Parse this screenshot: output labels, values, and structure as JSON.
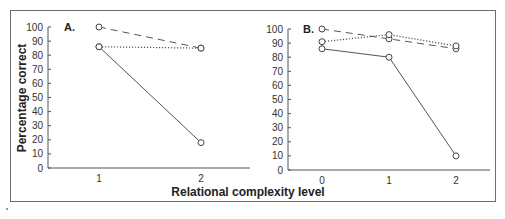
{
  "chart_data": [
    {
      "type": "line",
      "panel_label": "A.",
      "x": [
        1,
        2
      ],
      "categories": [
        "1",
        "2"
      ],
      "xlabel": "Relational complexity level",
      "ylabel": "Percentage correct",
      "ylim": [
        0,
        100
      ],
      "yticks": [
        0,
        10,
        20,
        30,
        40,
        50,
        60,
        70,
        80,
        90,
        100
      ],
      "grid": false,
      "series": [
        {
          "name": "dashed",
          "line_style": "dashed",
          "values": [
            100,
            85
          ]
        },
        {
          "name": "dotted",
          "line_style": "dotted",
          "values": [
            86,
            85
          ]
        },
        {
          "name": "solid",
          "line_style": "solid",
          "values": [
            86,
            18
          ]
        }
      ]
    },
    {
      "type": "line",
      "panel_label": "B.",
      "x": [
        0,
        1,
        2
      ],
      "categories": [
        "0",
        "1",
        "2"
      ],
      "xlabel": "Relational complexity level",
      "ylabel": "",
      "ylim": [
        0,
        100
      ],
      "yticks": [
        0,
        10,
        20,
        30,
        40,
        50,
        60,
        70,
        80,
        90,
        100
      ],
      "grid": false,
      "series": [
        {
          "name": "dashed",
          "line_style": "dashed",
          "values": [
            100,
            93,
            86
          ]
        },
        {
          "name": "dotted",
          "line_style": "dotted",
          "values": [
            91,
            96,
            88
          ]
        },
        {
          "name": "solid",
          "line_style": "solid",
          "values": [
            86,
            80,
            10
          ]
        }
      ]
    }
  ],
  "labels": {
    "y_axis_title": "Percentage correct",
    "x_axis_title": "Relational complexity level",
    "panel_a": "A.",
    "panel_b": "B."
  },
  "colors": {
    "line": "#555555",
    "frame": "#6d6d6d",
    "marker_fill": "#ffffff"
  }
}
